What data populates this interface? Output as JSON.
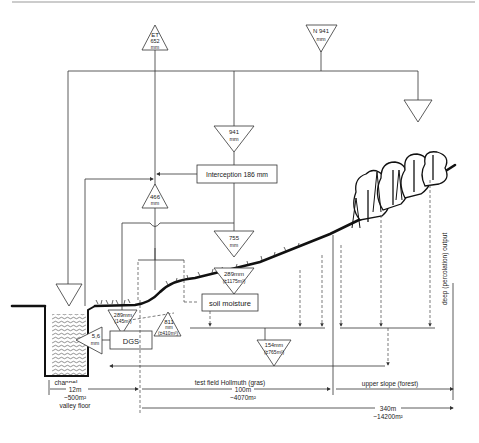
{
  "diagram": {
    "inputs": {
      "precipitation": {
        "label": "N 941",
        "unit": "mm"
      },
      "evapotranspiration": {
        "label": "ET",
        "value": "652",
        "unit": "mm"
      },
      "gross_rain": {
        "value": "941",
        "unit": "mm"
      }
    },
    "boxes": {
      "interception": "Interception 186 mm",
      "soil_moisture": "soil moisture",
      "dgs": "DGS"
    },
    "flows": {
      "evap_466": {
        "value": "466",
        "unit": "mm"
      },
      "net_rain_755": {
        "value": "755",
        "unit": "mm"
      },
      "infiltration_289": {
        "value": "289mm",
        "sub": "(±1175m³)"
      },
      "valley_289": {
        "value": "289mm",
        "sub": "(145m³)"
      },
      "lateral_811": {
        "value": "811",
        "unit": "mm",
        "sub": "(±410m³)"
      },
      "outflow_5_6": {
        "value": "5,6",
        "unit": "mm"
      },
      "deep_154": {
        "value": "154mm",
        "sub": "(±765m³)"
      }
    },
    "labels": {
      "channel": "channel",
      "deep_output": "deep (percolation) output",
      "valley_len": "12m",
      "valley_area": "~500m²",
      "valley_name": "valley floor",
      "test_field_name": "test field Hollmuth (gras)",
      "test_field_len": "100m",
      "test_field_area": "~4070m²",
      "upper_slope": "upper slope  (forest)",
      "total_len": "340m",
      "total_area": "~14200m²"
    }
  }
}
